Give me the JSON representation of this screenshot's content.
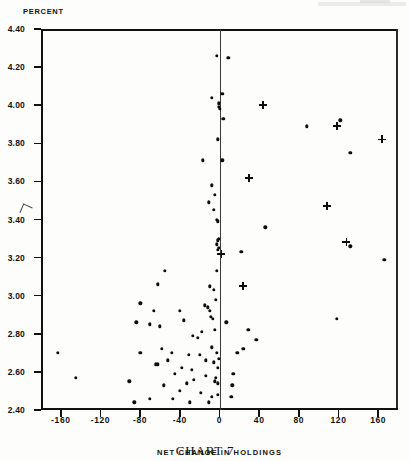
{
  "figure": {
    "caption": "CHART 7",
    "y_axis_unit_label": "PERCENT",
    "x_axis_title": "NET CHANGE IN HOLDINGS",
    "x_axis_unit": "( $ MILLION )"
  },
  "chart_data": {
    "type": "scatter",
    "title": "CHART 7",
    "xlabel": "NET CHANGE IN HOLDINGS ( $ MILLION )",
    "ylabel": "PERCENT",
    "xlim": [
      -180,
      180
    ],
    "ylim": [
      2.4,
      4.4
    ],
    "xticks": [
      -160,
      -120,
      -80,
      -40,
      0,
      40,
      80,
      120,
      160
    ],
    "xticklabels": [
      "-160",
      "-120",
      "-80",
      "-40",
      "0",
      "40",
      "80",
      "120",
      "160"
    ],
    "yticks": [
      2.4,
      2.6,
      2.8,
      3.0,
      3.2,
      3.4,
      3.6,
      3.8,
      4.0,
      4.2,
      4.4
    ],
    "yticklabels": [
      "2.40",
      "2.60",
      "2.80",
      "3.00",
      "3.20",
      "3.40",
      "3.60",
      "3.80",
      "4.00",
      "4.20",
      "4.40"
    ],
    "grid": false,
    "legend": null,
    "reference_line": {
      "orientation": "vertical",
      "x": 0
    },
    "series": [
      {
        "name": "dot-markers",
        "marker": "circle",
        "color": "#0d0d0d",
        "points": [
          [
            -3,
            4.26
          ],
          [
            9,
            4.25
          ],
          [
            -8,
            4.04
          ],
          [
            3,
            4.06
          ],
          [
            -1,
            4.01
          ],
          [
            -1,
            3.99
          ],
          [
            0,
            3.98
          ],
          [
            4,
            3.93
          ],
          [
            122,
            3.92
          ],
          [
            88,
            3.89
          ],
          [
            132,
            3.75
          ],
          [
            -2,
            3.82
          ],
          [
            -17,
            3.71
          ],
          [
            3,
            3.71
          ],
          [
            -8,
            3.58
          ],
          [
            -5,
            3.53
          ],
          [
            -11,
            3.49
          ],
          [
            -6,
            3.45
          ],
          [
            -3,
            3.4
          ],
          [
            -2,
            3.39
          ],
          [
            46,
            3.36
          ],
          [
            -1,
            3.3
          ],
          [
            -2,
            3.29
          ],
          [
            -3,
            3.27
          ],
          [
            132,
            3.26
          ],
          [
            -1,
            3.25
          ],
          [
            -2,
            3.24
          ],
          [
            166,
            3.19
          ],
          [
            22,
            3.23
          ],
          [
            -55,
            3.13
          ],
          [
            -3,
            3.13
          ],
          [
            -62,
            3.06
          ],
          [
            -10,
            3.05
          ],
          [
            -6,
            3.03
          ],
          [
            -80,
            2.96
          ],
          [
            -4,
            2.98
          ],
          [
            -66,
            2.92
          ],
          [
            -40,
            2.92
          ],
          [
            -15,
            2.95
          ],
          [
            -12,
            2.94
          ],
          [
            -10,
            2.92
          ],
          [
            -84,
            2.86
          ],
          [
            -70,
            2.85
          ],
          [
            -60,
            2.84
          ],
          [
            -36,
            2.87
          ],
          [
            -9,
            2.89
          ],
          [
            -7,
            2.88
          ],
          [
            -5,
            2.82
          ],
          [
            -18,
            2.81
          ],
          [
            -27,
            2.79
          ],
          [
            -22,
            2.78
          ],
          [
            7,
            2.86
          ],
          [
            29,
            2.82
          ],
          [
            118,
            2.88
          ],
          [
            -80,
            2.7
          ],
          [
            -163,
            2.7
          ],
          [
            -31,
            2.69
          ],
          [
            -48,
            2.7
          ],
          [
            -8,
            2.73
          ],
          [
            -20,
            2.69
          ],
          [
            -3,
            2.7
          ],
          [
            -64,
            2.64
          ],
          [
            -62,
            2.64
          ],
          [
            -38,
            2.62
          ],
          [
            -14,
            2.66
          ],
          [
            -6,
            2.65
          ],
          [
            -1,
            2.67
          ],
          [
            -2,
            2.62
          ],
          [
            -145,
            2.57
          ],
          [
            -91,
            2.55
          ],
          [
            -56,
            2.53
          ],
          [
            -33,
            2.54
          ],
          [
            -26,
            2.56
          ],
          [
            -4,
            2.57
          ],
          [
            -5,
            2.55
          ],
          [
            -2,
            2.54
          ],
          [
            -40,
            2.5
          ],
          [
            -19,
            2.49
          ],
          [
            -8,
            2.47
          ],
          [
            -2,
            2.48
          ],
          [
            -11,
            2.44
          ],
          [
            14,
            2.59
          ],
          [
            18,
            2.7
          ],
          [
            37,
            2.77
          ],
          [
            24,
            2.72
          ],
          [
            12,
            2.47
          ],
          [
            13,
            2.53
          ],
          [
            -30,
            2.44
          ],
          [
            -47,
            2.46
          ],
          [
            -70,
            2.46
          ],
          [
            -86,
            2.44
          ],
          [
            -14,
            2.58
          ],
          [
            -28,
            2.61
          ],
          [
            -45,
            2.59
          ],
          [
            -52,
            2.66
          ],
          [
            -58,
            2.72
          ]
        ]
      },
      {
        "name": "plus-markers",
        "marker": "plus",
        "color": "#0d0d0d",
        "points": [
          [
            44,
            4.0
          ],
          [
            30,
            3.62
          ],
          [
            24,
            3.05
          ],
          [
            2,
            3.22
          ],
          [
            118,
            3.89
          ],
          [
            164,
            3.82
          ],
          [
            108,
            3.47
          ],
          [
            128,
            3.28
          ]
        ]
      }
    ]
  }
}
